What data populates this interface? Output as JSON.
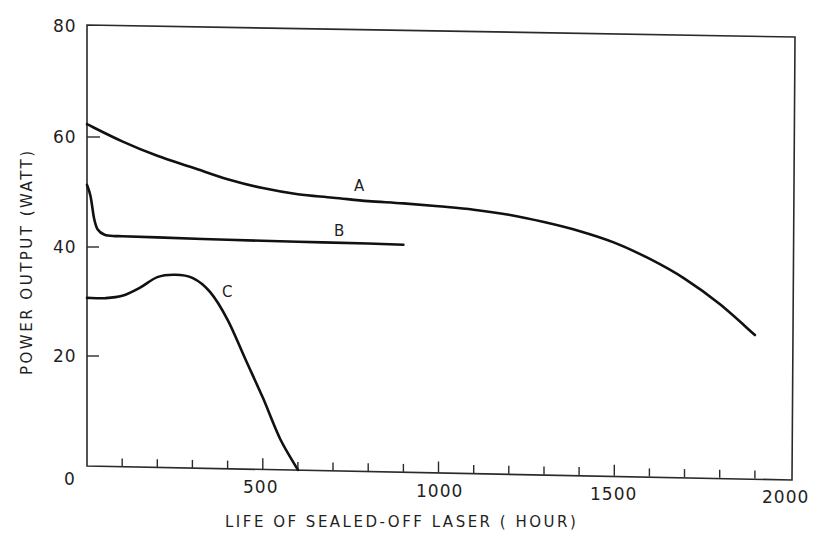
{
  "chart_data": {
    "type": "line",
    "title": "",
    "xlabel": "LIFE OF SEALED-OFF LASER ( HOUR)",
    "ylabel": "POWER OUTPUT (WATT)",
    "xlim": [
      0,
      2000
    ],
    "ylim": [
      0,
      80
    ],
    "x_ticks": [
      "0",
      "500",
      "1000",
      "1500",
      "2000"
    ],
    "y_ticks": [
      "0",
      "20",
      "40",
      "60",
      "80"
    ],
    "x_minor_tick_step": 100,
    "grid": false,
    "legend": "none (curves labeled inline)",
    "series": [
      {
        "name": "A",
        "x": [
          0,
          100,
          200,
          300,
          400,
          500,
          600,
          700,
          800,
          900,
          1000,
          1100,
          1200,
          1300,
          1400,
          1500,
          1600,
          1700,
          1800,
          1900
        ],
        "y": [
          62,
          59,
          56.5,
          54.5,
          52.5,
          51,
          50,
          49.5,
          49,
          48.7,
          48.3,
          47.8,
          47,
          45.8,
          44.3,
          42.3,
          39.5,
          36,
          31.5,
          26
        ]
      },
      {
        "name": "B",
        "x": [
          0,
          10,
          20,
          30,
          50,
          80,
          100,
          200,
          400,
          600,
          800,
          900
        ],
        "y": [
          51,
          49,
          45,
          43,
          42,
          41.8,
          41.8,
          41.7,
          41.5,
          41.4,
          41.3,
          41.2
        ]
      },
      {
        "name": "C",
        "x": [
          0,
          50,
          100,
          150,
          200,
          250,
          300,
          350,
          400,
          450,
          500,
          550,
          600
        ],
        "y": [
          30.5,
          30.5,
          31,
          32.5,
          34.5,
          35,
          34.5,
          32,
          27,
          20,
          13,
          5.5,
          0
        ]
      }
    ],
    "annotations": [
      {
        "text": "A",
        "x": 780,
        "y": 51
      },
      {
        "text": "B",
        "x": 730,
        "y": 43.5
      },
      {
        "text": "C",
        "x": 405,
        "y": 33
      }
    ]
  },
  "axes": {
    "y_title": "POWER OUTPUT (WATT)",
    "x_title": "LIFE OF SEALED-OFF LASER ( HOUR)",
    "y_tick_labels": [
      "80",
      "60",
      "40",
      "20",
      "0"
    ],
    "x_tick_labels": [
      "500",
      "1000",
      "1500",
      "2000"
    ]
  },
  "labels": {
    "a": "A",
    "b": "B",
    "c": "C"
  }
}
